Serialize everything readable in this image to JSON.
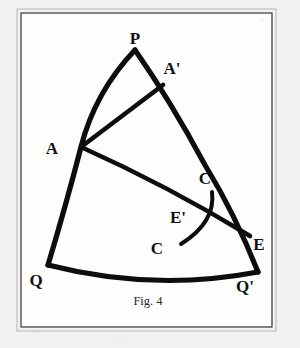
{
  "figure": {
    "caption": "Fig. 4",
    "background_color": "#f2f1ef",
    "plate_color": "#fdfdfc",
    "ink_color": "#0d0d0d",
    "frame_color": "#3a3a3a",
    "frame": {
      "x": 21,
      "y": 13,
      "width": 251,
      "height": 314
    },
    "labels": [
      {
        "id": "P",
        "text": "P",
        "x": 135,
        "y": 44
      },
      {
        "id": "Ap",
        "text": "A'",
        "x": 172,
        "y": 74
      },
      {
        "id": "A",
        "text": "A",
        "x": 52,
        "y": 154
      },
      {
        "id": "Cu",
        "text": "C",
        "x": 205,
        "y": 184
      },
      {
        "id": "Ep",
        "text": "E'",
        "x": 178,
        "y": 223
      },
      {
        "id": "Cl",
        "text": "C",
        "x": 157,
        "y": 254
      },
      {
        "id": "E",
        "text": "E",
        "x": 259,
        "y": 250
      },
      {
        "id": "Q",
        "text": "Q",
        "x": 36,
        "y": 286
      },
      {
        "id": "Qp",
        "text": "Q'",
        "x": 245,
        "y": 292
      }
    ],
    "vertices": [
      {
        "id": "P",
        "x": 135,
        "y": 50
      },
      {
        "id": "A",
        "x": 81,
        "y": 147
      },
      {
        "id": "Ap",
        "x": 163,
        "y": 85
      },
      {
        "id": "Q",
        "x": 48,
        "y": 265
      },
      {
        "id": "Qp",
        "x": 258,
        "y": 272
      },
      {
        "id": "E",
        "x": 250,
        "y": 236
      },
      {
        "id": "Ep",
        "x": 205,
        "y": 213
      },
      {
        "id": "Cu",
        "x": 212,
        "y": 192
      },
      {
        "id": "Cl",
        "x": 181,
        "y": 244
      }
    ],
    "curves": [
      {
        "id": "arc-P-A-Q",
        "name": "left-arc-p-to-q",
        "d": "M 135 50 Q 95 92 81 147 Q 66 205 48 265",
        "weight": "arc-major"
      },
      {
        "id": "arc-P-Ap-Qp",
        "name": "right-arc-p-to-qprime",
        "d": "M 135 50 Q 170 100 205 165 Q 235 214 258 272",
        "weight": "arc-major"
      },
      {
        "id": "arc-Q-Qp",
        "name": "bottom-arc-q-to-qprime",
        "d": "M 48 265 Q 153 292 258 272",
        "weight": "arc-major"
      },
      {
        "id": "seg-A-Ap",
        "name": "chord-a-to-aprime",
        "d": "M 81 147 L 163 85",
        "weight": "arc-mid"
      },
      {
        "id": "arc-A-E",
        "name": "arc-a-to-e",
        "d": "M 81 147 Q 168 186 250 236",
        "weight": "arc-mid"
      },
      {
        "id": "curve-C-C",
        "name": "curve-c-to-cprime",
        "d": "M 212 192 Q 216 222 181 244",
        "weight": "arc-minor"
      }
    ]
  }
}
